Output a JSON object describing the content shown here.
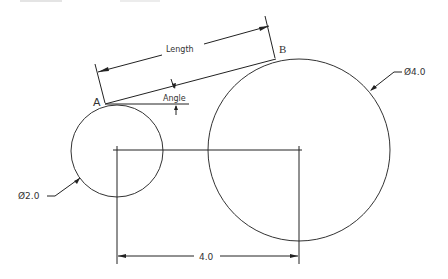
{
  "diagram": {
    "labels": {
      "point_a": "A",
      "point_b": "B",
      "length": "Length",
      "angle": "Angle",
      "small_diameter": "Ø2.0",
      "large_diameter": "Ø4.0",
      "center_distance": "4.0"
    },
    "small_circle": {
      "diameter": "2.0"
    },
    "large_circle": {
      "diameter": "4.0"
    },
    "center_distance": "4.0"
  }
}
